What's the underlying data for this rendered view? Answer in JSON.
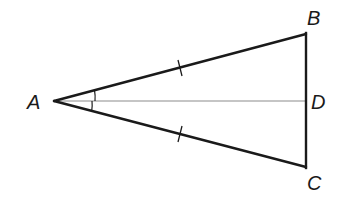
{
  "diagram": {
    "type": "isosceles-triangle-with-angle-bisector",
    "points": {
      "A": {
        "label": "A",
        "x": 54,
        "y": 101
      },
      "B": {
        "label": "B",
        "x": 306,
        "y": 34
      },
      "C": {
        "label": "C",
        "x": 306,
        "y": 167
      },
      "D": {
        "label": "D",
        "x": 306,
        "y": 101
      }
    },
    "segments": [
      {
        "from": "A",
        "to": "B",
        "style": "thick",
        "tick_marks": 1
      },
      {
        "from": "A",
        "to": "C",
        "style": "thick",
        "tick_marks": 1
      },
      {
        "from": "B",
        "to": "C",
        "style": "thick",
        "tick_marks": 0
      },
      {
        "from": "A",
        "to": "D",
        "style": "thin-gray",
        "tick_marks": 0
      }
    ],
    "angle_marks": [
      {
        "vertex": "A",
        "between": [
          "B",
          "D"
        ],
        "arcs": 1
      },
      {
        "vertex": "A",
        "between": [
          "D",
          "C"
        ],
        "arcs": 1
      }
    ],
    "colors": {
      "line": "#1a1a1a",
      "bisector": "#8c8c8c",
      "background": "#ffffff"
    }
  }
}
